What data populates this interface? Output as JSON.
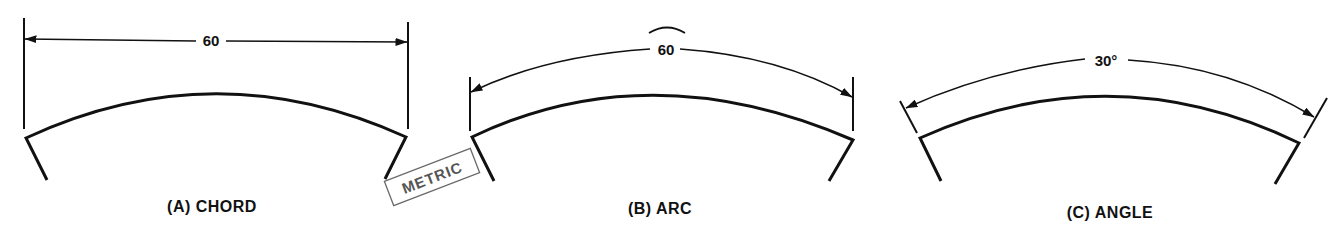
{
  "figure": {
    "panels": [
      {
        "id": "A",
        "label": "(A) CHORD",
        "dimension_value": "60",
        "dimension_type": "chord"
      },
      {
        "id": "B",
        "label": "(B) ARC",
        "dimension_value": "60",
        "dimension_type": "arc",
        "arc_symbol": "⌒"
      },
      {
        "id": "C",
        "label": "(C) ANGLE",
        "dimension_value": "30°",
        "dimension_type": "angle"
      }
    ],
    "stamp": {
      "text": "METRIC"
    },
    "colors": {
      "line": "#111111",
      "stamp": "#6a6a6a",
      "background": "#ffffff"
    }
  }
}
